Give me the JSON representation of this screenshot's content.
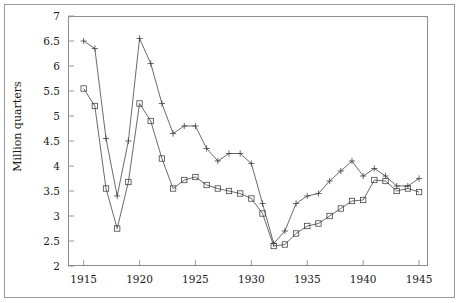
{
  "chart_data": {
    "type": "line",
    "title": "",
    "subtitle": "",
    "xlabel": "",
    "ylabel": "Million quarters",
    "xlim": [
      1913.6,
      1945.8
    ],
    "ylim": [
      2,
      7
    ],
    "grid": false,
    "legend": null,
    "yticks": [
      2,
      2.5,
      3,
      3.5,
      4,
      4.5,
      5,
      5.5,
      6,
      6.5,
      7
    ],
    "ytick_labels": [
      "2",
      "2.5",
      "3",
      "3.5",
      "4",
      "4.5",
      "5",
      "5.5",
      "6",
      "6.5",
      "7"
    ],
    "xticks": [
      1915,
      1920,
      1925,
      1930,
      1935,
      1940,
      1945
    ],
    "xtick_labels": [
      "1915",
      "1920",
      "1925",
      "1930",
      "1935",
      "1940",
      "1945"
    ],
    "series": [
      {
        "name": "series-plus",
        "marker": "plus",
        "color": "#3a3a3a",
        "x": [
          1915,
          1916,
          1917,
          1918,
          1919,
          1920,
          1921,
          1922,
          1923,
          1924,
          1925,
          1926,
          1927,
          1928,
          1929,
          1930,
          1931,
          1932,
          1933,
          1934,
          1935,
          1936,
          1937,
          1938,
          1939,
          1940,
          1941,
          1942,
          1943,
          1944,
          1945
        ],
        "y": [
          6.5,
          6.35,
          4.55,
          3.4,
          4.5,
          6.55,
          6.05,
          5.25,
          4.65,
          4.8,
          4.8,
          4.35,
          4.1,
          4.25,
          4.25,
          4.05,
          3.25,
          2.45,
          2.7,
          3.25,
          3.4,
          3.45,
          3.7,
          3.9,
          4.1,
          3.8,
          3.95,
          3.8,
          3.6,
          3.6,
          3.75
        ]
      },
      {
        "name": "series-square",
        "marker": "square",
        "color": "#3a3a3a",
        "x": [
          1915,
          1916,
          1917,
          1918,
          1919,
          1920,
          1921,
          1922,
          1923,
          1924,
          1925,
          1926,
          1927,
          1928,
          1929,
          1930,
          1931,
          1932,
          1933,
          1934,
          1935,
          1936,
          1937,
          1938,
          1939,
          1940,
          1941,
          1942,
          1943,
          1944,
          1945
        ],
        "y": [
          5.55,
          5.2,
          3.55,
          2.75,
          3.68,
          5.25,
          4.9,
          4.15,
          3.55,
          3.72,
          3.78,
          3.62,
          3.55,
          3.5,
          3.45,
          3.35,
          3.05,
          2.4,
          2.43,
          2.65,
          2.8,
          2.85,
          3.0,
          3.15,
          3.3,
          3.32,
          3.72,
          3.7,
          3.5,
          3.55,
          3.48
        ]
      }
    ]
  },
  "axis": {
    "ylabel": "Million quarters"
  }
}
